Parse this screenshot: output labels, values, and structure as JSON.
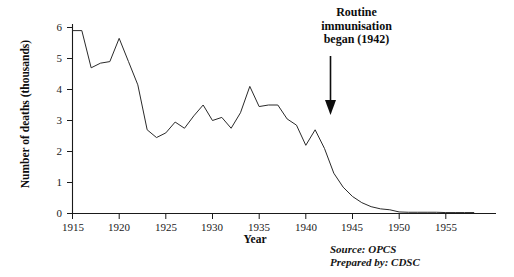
{
  "chart_data": {
    "type": "line",
    "title": "",
    "xlabel": "Year",
    "ylabel": "Number of deaths (thousands)",
    "xlim": [
      1915,
      1958
    ],
    "ylim": [
      0,
      6
    ],
    "grid": false,
    "legend": "none",
    "x": [
      1915,
      1916,
      1917,
      1918,
      1919,
      1920,
      1921,
      1922,
      1923,
      1924,
      1925,
      1926,
      1927,
      1928,
      1929,
      1930,
      1931,
      1932,
      1933,
      1934,
      1935,
      1936,
      1937,
      1938,
      1939,
      1940,
      1941,
      1942,
      1943,
      1944,
      1945,
      1946,
      1947,
      1948,
      1949,
      1950,
      1951,
      1952,
      1953,
      1954,
      1955,
      1956,
      1957,
      1958
    ],
    "series": [
      {
        "name": "Diphtheria deaths",
        "values": [
          5.9,
          5.9,
          4.7,
          4.85,
          4.9,
          5.65,
          4.9,
          4.15,
          2.7,
          2.45,
          2.6,
          2.95,
          2.75,
          3.15,
          3.5,
          3.0,
          3.1,
          2.75,
          3.25,
          4.1,
          3.45,
          3.5,
          3.5,
          3.05,
          2.85,
          2.2,
          2.7,
          2.1,
          1.3,
          0.85,
          0.55,
          0.35,
          0.22,
          0.15,
          0.12,
          0.05,
          0.04,
          0.04,
          0.04,
          0.04,
          0.03,
          0.03,
          0.03,
          0.03
        ]
      }
    ],
    "yticks": [
      0,
      1,
      2,
      3,
      4,
      5,
      6
    ],
    "ytick_labels": [
      "0",
      "1",
      "2",
      "3",
      "4",
      "5",
      "6"
    ],
    "xticks": [
      1915,
      1920,
      1925,
      1930,
      1935,
      1940,
      1945,
      1950,
      1955
    ],
    "xtick_labels": [
      "1915",
      "1920",
      "1925",
      "1930",
      "1935",
      "1940",
      "1945",
      "1950",
      "1955"
    ],
    "annotations": [
      {
        "name": "routine-immunisation-annotation",
        "lines": [
          "Routine",
          "immunisation",
          "began (1942)"
        ],
        "line1": "Routine",
        "line2": "immunisation",
        "line3": "began (1942)",
        "points_to_year": 1942,
        "arrow": "down-arrow"
      }
    ],
    "source": "Source: OPCS",
    "prepared_by": "Prepared by: CDSC",
    "line_color": "#2a2a2a",
    "axis_color": "#1a1a1a",
    "background_color": "#ffffff"
  }
}
